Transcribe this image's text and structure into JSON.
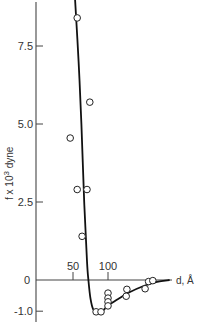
{
  "chart_data": {
    "type": "scatter",
    "title": "",
    "xlabel": "d, Å",
    "ylabel": "f x 10³ dyne",
    "ylabel_parts": {
      "base": "f x 10",
      "sup": "3",
      "unit": "dyne"
    },
    "xlim": [
      0,
      200
    ],
    "ylim": [
      -1.2,
      9.0
    ],
    "x_ticks": [
      {
        "value": 50,
        "label": "50"
      },
      {
        "value": 100,
        "label": "100"
      }
    ],
    "y_ticks": [
      {
        "value": -1.0,
        "label": "-1.0"
      },
      {
        "value": 0,
        "label": "0"
      },
      {
        "value": 2.5,
        "label": "2.5"
      },
      {
        "value": 5.0,
        "label": "5.0"
      },
      {
        "value": 7.5,
        "label": "7.5"
      }
    ],
    "grid": false,
    "legend": null,
    "series": [
      {
        "name": "measured",
        "kind": "scatter",
        "marker": "open-circle",
        "points": [
          {
            "x": 56,
            "y": 8.4
          },
          {
            "x": 74,
            "y": 5.7
          },
          {
            "x": 46,
            "y": 4.55
          },
          {
            "x": 56,
            "y": 2.9
          },
          {
            "x": 70,
            "y": 2.9
          },
          {
            "x": 63,
            "y": 1.4
          },
          {
            "x": 83,
            "y": -1.02
          },
          {
            "x": 90,
            "y": -1.02
          },
          {
            "x": 100,
            "y": -0.42
          },
          {
            "x": 100,
            "y": -0.58
          },
          {
            "x": 100,
            "y": -0.7
          },
          {
            "x": 100,
            "y": -0.83
          },
          {
            "x": 127,
            "y": -0.3
          },
          {
            "x": 126,
            "y": -0.52
          },
          {
            "x": 153,
            "y": -0.28
          },
          {
            "x": 158,
            "y": -0.05
          },
          {
            "x": 164,
            "y": -0.02
          }
        ]
      },
      {
        "name": "fitted curve",
        "kind": "line",
        "points": [
          {
            "x": 53,
            "y": 9.0
          },
          {
            "x": 58,
            "y": 7.0
          },
          {
            "x": 62,
            "y": 5.0
          },
          {
            "x": 66,
            "y": 2.5
          },
          {
            "x": 70,
            "y": 0.6
          },
          {
            "x": 72,
            "y": 0
          },
          {
            "x": 75,
            "y": -0.6
          },
          {
            "x": 79,
            "y": -0.95
          },
          {
            "x": 85,
            "y": -1.05
          },
          {
            "x": 92,
            "y": -1.0
          },
          {
            "x": 100,
            "y": -0.82
          },
          {
            "x": 115,
            "y": -0.6
          },
          {
            "x": 130,
            "y": -0.4
          },
          {
            "x": 150,
            "y": -0.2
          },
          {
            "x": 170,
            "y": -0.06
          },
          {
            "x": 188,
            "y": 0
          }
        ]
      }
    ]
  },
  "layout": {
    "plot": {
      "x0_px": 38,
      "px_per_x": 0.7,
      "y0_px": 280,
      "px_per_y": 31.2
    },
    "axis_color": "#444444",
    "curve_color": "#111111"
  }
}
